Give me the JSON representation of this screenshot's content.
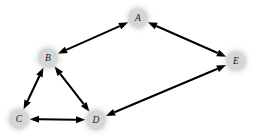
{
  "diagram": {
    "type": "undirected-graph",
    "title": "",
    "background_color": "#ffffff",
    "node_fill_color": "#d6d6d6",
    "edge_color": "#000000",
    "label_color": "#1a1a1a",
    "nodes": [
      {
        "id": "A",
        "label": "A",
        "x": 138,
        "y": 18,
        "r": 9.5
      },
      {
        "id": "B",
        "label": "B",
        "x": 48,
        "y": 58,
        "r": 9.5
      },
      {
        "id": "C",
        "label": "C",
        "x": 19,
        "y": 119,
        "r": 9.5
      },
      {
        "id": "D",
        "label": "D",
        "x": 96,
        "y": 120,
        "r": 9.5
      },
      {
        "id": "E",
        "label": "E",
        "x": 236,
        "y": 61,
        "r": 9.5
      }
    ],
    "edges": [
      {
        "id": "A-B",
        "from": "A",
        "to": "B",
        "bidirectional": true
      },
      {
        "id": "A-E",
        "from": "A",
        "to": "E",
        "bidirectional": true
      },
      {
        "id": "B-C",
        "from": "B",
        "to": "C",
        "bidirectional": true
      },
      {
        "id": "B-D",
        "from": "B",
        "to": "D",
        "bidirectional": true
      },
      {
        "id": "C-D",
        "from": "C",
        "to": "D",
        "bidirectional": true
      },
      {
        "id": "D-E",
        "from": "D",
        "to": "E",
        "bidirectional": true
      }
    ]
  }
}
